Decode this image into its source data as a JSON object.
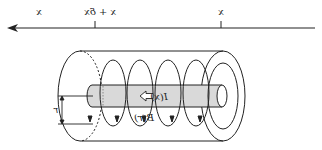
{
  "figure": {
    "mirrored_horizontally": true,
    "axis": {
      "labels": {
        "far_left": "x",
        "tick_1": "x + δx",
        "tick_2": "x"
      },
      "direction": "arrow pointing left"
    },
    "cylinder": {
      "current_label": "I(x)",
      "field_label": "B(r)",
      "radius_label": "r"
    },
    "colors": {
      "line": "#222222",
      "rod_fill": "#d9d9d9",
      "background": "#ffffff"
    }
  }
}
